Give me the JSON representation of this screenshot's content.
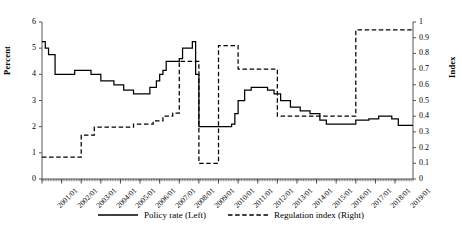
{
  "chart_data": {
    "type": "line",
    "title": "",
    "xlabel": "",
    "ylabel": "Percent",
    "ylabel_right": "Index",
    "ylim": [
      0,
      6
    ],
    "ylim_right": [
      0,
      1
    ],
    "grid": false,
    "legend_position": "bottom",
    "x_tick_labels": [
      "2001/01",
      "2002/01",
      "2003/01",
      "2004/01",
      "2005/01",
      "2006/01",
      "2007/01",
      "2008/01",
      "2009/01",
      "2010/01",
      "2011/01",
      "2012/01",
      "2013/01",
      "2014/01",
      "2015/01",
      "2016/01",
      "2017/01",
      "2018/01",
      "2019/01"
    ],
    "y_tick_labels_left": [
      "0",
      "1",
      "2",
      "3",
      "4",
      "5",
      "6"
    ],
    "y_tick_labels_right": [
      "0",
      "0.1",
      "0.2",
      "0.3",
      "0.4",
      "0.5",
      "0.6",
      "0.7",
      "0.8",
      "0.9",
      "1"
    ],
    "x_start": "2001/01",
    "x_end": "2019/12",
    "series": [
      {
        "name": "Policy rate (Left)",
        "axis": "left",
        "style": "solid",
        "color": "#000000",
        "steps": [
          {
            "x": "2001/01",
            "y": 5.25
          },
          {
            "x": "2001/03",
            "y": 5.0
          },
          {
            "x": "2001/05",
            "y": 4.75
          },
          {
            "x": "2001/09",
            "y": 4.0
          },
          {
            "x": "2002/09",
            "y": 4.15
          },
          {
            "x": "2003/07",
            "y": 4.0
          },
          {
            "x": "2004/01",
            "y": 3.75
          },
          {
            "x": "2004/09",
            "y": 3.6
          },
          {
            "x": "2005/03",
            "y": 3.4
          },
          {
            "x": "2005/09",
            "y": 3.25
          },
          {
            "x": "2006/07",
            "y": 3.5
          },
          {
            "x": "2006/11",
            "y": 3.75
          },
          {
            "x": "2007/01",
            "y": 4.0
          },
          {
            "x": "2007/03",
            "y": 4.15
          },
          {
            "x": "2007/05",
            "y": 4.5
          },
          {
            "x": "2008/01",
            "y": 4.6
          },
          {
            "x": "2008/03",
            "y": 5.0
          },
          {
            "x": "2008/09",
            "y": 5.25
          },
          {
            "x": "2008/11",
            "y": 4.0
          },
          {
            "x": "2009/01",
            "y": 2.0
          },
          {
            "x": "2010/09",
            "y": 2.1
          },
          {
            "x": "2010/11",
            "y": 2.5
          },
          {
            "x": "2011/01",
            "y": 3.0
          },
          {
            "x": "2011/05",
            "y": 3.4
          },
          {
            "x": "2011/09",
            "y": 3.5
          },
          {
            "x": "2012/07",
            "y": 3.4
          },
          {
            "x": "2012/11",
            "y": 3.25
          },
          {
            "x": "2013/03",
            "y": 3.0
          },
          {
            "x": "2013/09",
            "y": 2.75
          },
          {
            "x": "2014/03",
            "y": 2.6
          },
          {
            "x": "2014/09",
            "y": 2.5
          },
          {
            "x": "2015/03",
            "y": 2.25
          },
          {
            "x": "2015/07",
            "y": 2.1
          },
          {
            "x": "2017/01",
            "y": 2.25
          },
          {
            "x": "2017/09",
            "y": 2.3
          },
          {
            "x": "2018/03",
            "y": 2.4
          },
          {
            "x": "2018/11",
            "y": 2.3
          },
          {
            "x": "2019/03",
            "y": 2.05
          }
        ]
      },
      {
        "name": "Regulation index (Right)",
        "axis": "right",
        "style": "dashed",
        "color": "#000000",
        "steps": [
          {
            "x": "2001/01",
            "y": 0.14
          },
          {
            "x": "2003/01",
            "y": 0.28
          },
          {
            "x": "2003/09",
            "y": 0.33
          },
          {
            "x": "2005/09",
            "y": 0.35
          },
          {
            "x": "2006/09",
            "y": 0.37
          },
          {
            "x": "2007/03",
            "y": 0.4
          },
          {
            "x": "2007/09",
            "y": 0.42
          },
          {
            "x": "2008/01",
            "y": 0.75
          },
          {
            "x": "2008/11",
            "y": 0.75
          },
          {
            "x": "2009/01",
            "y": 0.1
          },
          {
            "x": "2010/01",
            "y": 0.85
          },
          {
            "x": "2010/11",
            "y": 0.85
          },
          {
            "x": "2011/01",
            "y": 0.7
          },
          {
            "x": "2012/09",
            "y": 0.7
          },
          {
            "x": "2013/01",
            "y": 0.4
          },
          {
            "x": "2016/09",
            "y": 0.4
          },
          {
            "x": "2017/01",
            "y": 0.95
          },
          {
            "x": "2019/12",
            "y": 0.95
          }
        ]
      }
    ]
  },
  "legend": {
    "items": [
      {
        "label": "Policy rate (Left)",
        "style": "solid"
      },
      {
        "label": "Regulation index (Right)",
        "style": "dashed"
      }
    ]
  }
}
